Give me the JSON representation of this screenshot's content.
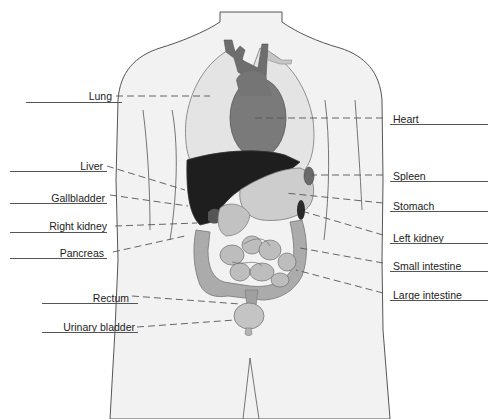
{
  "diagram": {
    "type": "anatomical-torso",
    "title": "",
    "colors": {
      "background": "#ffffff",
      "skin": "#f0f0f0",
      "outline": "#555555",
      "lung": "#e6e6e6",
      "heart": "#7a7a7a",
      "liver": "#1e1e1e",
      "organs_mid": "#b8b8b8",
      "intestine": "#a8a8a8",
      "dark_organ": "#2a2a2a",
      "leader": "#555555"
    },
    "labels_left": [
      {
        "id": "lung",
        "text": "Lung"
      },
      {
        "id": "liver",
        "text": "Liver"
      },
      {
        "id": "gallbladder",
        "text": "Gallbladder"
      },
      {
        "id": "right-kidney",
        "text": "Right kidney"
      },
      {
        "id": "pancreas",
        "text": "Pancreas"
      },
      {
        "id": "rectum",
        "text": "Rectum"
      },
      {
        "id": "urinary-bladder",
        "text": "Urinary bladder"
      }
    ],
    "labels_right": [
      {
        "id": "heart",
        "text": "Heart"
      },
      {
        "id": "spleen",
        "text": "Spleen"
      },
      {
        "id": "stomach",
        "text": "Stomach"
      },
      {
        "id": "left-kidney",
        "text": "Left kidney"
      },
      {
        "id": "small-intestine",
        "text": "Small intestine"
      },
      {
        "id": "large-intestine",
        "text": "Large intestine"
      }
    ]
  }
}
